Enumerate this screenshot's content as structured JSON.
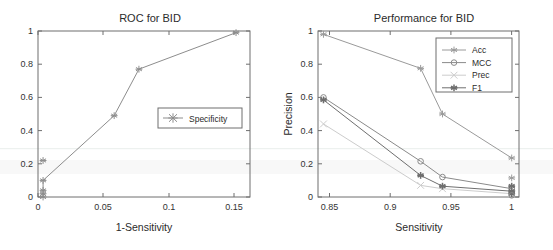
{
  "figure": {
    "background": "#ffffff",
    "axis_color": "#6f6f6f"
  },
  "chart_data": [
    {
      "id": "roc",
      "type": "line",
      "title": "ROC for BID",
      "xlabel": "1-Sensitivity",
      "ylabel": "",
      "xlim": [
        -0.004,
        0.163
      ],
      "ylim": [
        0,
        1
      ],
      "xticks": [
        0,
        0.05,
        0.1,
        0.15
      ],
      "xticklabels": [
        "0",
        "0.05",
        "0.1",
        "0.15"
      ],
      "yticks": [
        0,
        0.2,
        0.4,
        0.6,
        0.8,
        1
      ],
      "yticklabels": [
        "0",
        "0.2",
        "0.4",
        "0.6",
        "0.8",
        "1"
      ],
      "grid": false,
      "legend_position": "center-right",
      "series": [
        {
          "name": "Specificity",
          "color": "#8d8d8d",
          "marker": "asterisk",
          "x": [
            0,
            0,
            0,
            0,
            0.056,
            0.0755,
            0.152
          ],
          "y": [
            0,
            0.02,
            0.04,
            0.1,
            0.49,
            0.77,
            0.99
          ]
        },
        {
          "name": "Specificity-stack",
          "color": "#8d8d8d",
          "marker": "asterisk",
          "x": [
            0
          ],
          "y": [
            0.22
          ]
        }
      ]
    },
    {
      "id": "performance",
      "type": "line",
      "title": "Performance for BID",
      "xlabel": "Sensitivity",
      "ylabel": "Precision",
      "xlim": [
        0.8405,
        1.006
      ],
      "ylim": [
        0,
        1
      ],
      "xticks": [
        0.85,
        0.9,
        0.95,
        1
      ],
      "xticklabels": [
        "0.85",
        "0.9",
        "0.95",
        "1"
      ],
      "yticks": [
        0,
        0.2,
        0.4,
        0.6,
        0.8,
        1
      ],
      "yticklabels": [
        "0",
        "0.2",
        "0.4",
        "0.6",
        "0.8",
        "1"
      ],
      "grid": false,
      "legend_position": "top-right",
      "series": [
        {
          "name": "Acc",
          "color": "#9a9a9a",
          "marker": "asterisk",
          "x": [
            0.845,
            0.925,
            0.943,
            1.0
          ],
          "y": [
            0.98,
            0.775,
            0.5,
            0.235
          ]
        },
        {
          "name": "MCC",
          "color": "#8a8a8a",
          "marker": "circle",
          "x": [
            0.845,
            0.925,
            0.943,
            1.0
          ],
          "y": [
            0.6,
            0.215,
            0.12,
            0.05
          ]
        },
        {
          "name": "Prec",
          "color": "#cccccc",
          "marker": "cross",
          "x": [
            0.845,
            0.925,
            0.943,
            1.0
          ],
          "y": [
            0.44,
            0.07,
            0.05,
            0.02
          ]
        },
        {
          "name": "F1",
          "color": "#6e6e6e",
          "marker": "asterisk-filled",
          "x": [
            0.845,
            0.925,
            0.943,
            1.0
          ],
          "y": [
            0.585,
            0.13,
            0.065,
            0.035
          ]
        }
      ],
      "extra_markers": [
        {
          "x": 1.0,
          "y": 0.115,
          "color": "#9a9a9a",
          "marker": "asterisk"
        },
        {
          "x": 1.0,
          "y": 0.065,
          "color": "#6e6e6e",
          "marker": "asterisk-filled"
        },
        {
          "x": 1.0,
          "y": 0.02,
          "color": "#6e6e6e",
          "marker": "asterisk-filled"
        },
        {
          "x": 1.0,
          "y": 0.01,
          "color": "#8a8a8a",
          "marker": "circle"
        }
      ]
    }
  ]
}
